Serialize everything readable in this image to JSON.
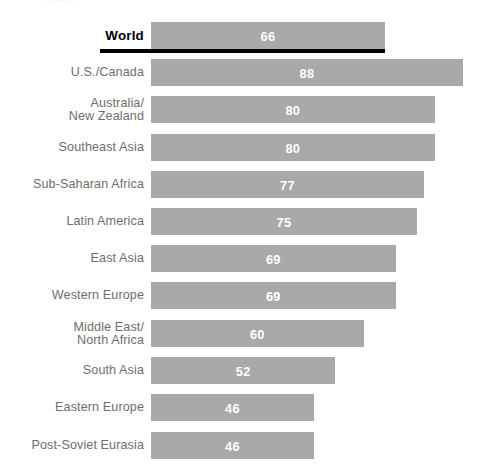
{
  "top_clipped_text": "Percent",
  "chart_data": {
    "type": "bar",
    "orientation": "horizontal",
    "title": "",
    "subtitle": "",
    "xlabel": "",
    "ylabel": "",
    "grid": false,
    "legend": false,
    "xlim": [
      0,
      100
    ],
    "value_label_color": "#ffffff",
    "bar_color": "#a9a9a9",
    "highlight_rule_color": "#000000",
    "categories": [
      "World",
      "U.S./Canada",
      "Australia/\nNew Zealand",
      "Southeast Asia",
      "Sub-Saharan Africa",
      "Latin America",
      "East Asia",
      "Western Europe",
      "Middle East/\nNorth Africa",
      "South Asia",
      "Eastern Europe",
      "Post-Soviet Eurasia"
    ],
    "values": [
      66,
      88,
      80,
      80,
      77,
      75,
      69,
      69,
      60,
      52,
      46,
      46
    ],
    "rows": [
      {
        "label": "World",
        "value": 66,
        "value_text": "66",
        "highlight": true,
        "top": 22
      },
      {
        "label": "U.S./Canada",
        "value": 88,
        "value_text": "88",
        "highlight": false,
        "top": 59
      },
      {
        "label": "Australia/\nNew Zealand",
        "value": 80,
        "value_text": "80",
        "highlight": false,
        "top": 96
      },
      {
        "label": "Southeast Asia",
        "value": 80,
        "value_text": "80",
        "highlight": false,
        "top": 134
      },
      {
        "label": "Sub-Saharan Africa",
        "value": 77,
        "value_text": "77",
        "highlight": false,
        "top": 171
      },
      {
        "label": "Latin America",
        "value": 75,
        "value_text": "75",
        "highlight": false,
        "top": 208
      },
      {
        "label": "East Asia",
        "value": 69,
        "value_text": "69",
        "highlight": false,
        "top": 245
      },
      {
        "label": "Western Europe",
        "value": 69,
        "value_text": "69",
        "highlight": false,
        "top": 282
      },
      {
        "label": "Middle East/\nNorth Africa",
        "value": 60,
        "value_text": "60",
        "highlight": false,
        "top": 320
      },
      {
        "label": "South Asia",
        "value": 52,
        "value_text": "52",
        "highlight": false,
        "top": 357
      },
      {
        "label": "Eastern Europe",
        "value": 46,
        "value_text": "46",
        "highlight": false,
        "top": 394
      },
      {
        "label": "Post-Soviet Eurasia",
        "value": 46,
        "value_text": "46",
        "highlight": false,
        "top": 432
      }
    ]
  }
}
